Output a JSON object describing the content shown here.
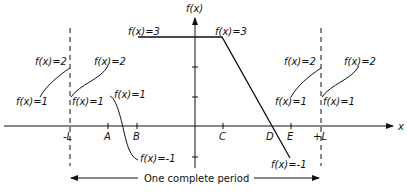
{
  "diagram": {
    "y_axis_label": "f(x)",
    "x_axis_label": "x",
    "x_ticks": [
      "-L",
      "A",
      "B",
      "C",
      "D",
      "E",
      "+L"
    ],
    "annotations": {
      "top_left_flat": "f(x)=3",
      "top_right_flat": "f(x)=3",
      "left_jump_top": "f(x)=2",
      "left_jump_after": "f(x)=2",
      "left_jump_bottom": "f(x)=1",
      "left_jump_bottom_after": "f(x)=1",
      "near_A_top": "f(x)=1",
      "near_B_bottom": "f(x)=-1",
      "right_jump_top": "f(x)=2",
      "right_jump_after": "f(x)=2",
      "right_before_L": "f(x)=1",
      "right_after_L": "f(x)=1",
      "slope_bottom": "f(x)=-1"
    },
    "period_label": "One complete period"
  }
}
